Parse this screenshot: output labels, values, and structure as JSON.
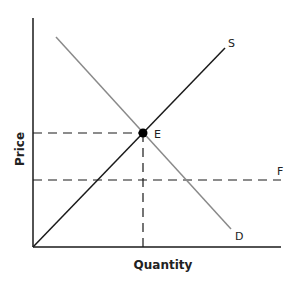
{
  "diagram": {
    "type": "supply-demand",
    "axes": {
      "x_label": "Quantity",
      "y_label": "Price"
    },
    "curves": [
      {
        "id": "supply",
        "label": "S",
        "color": "#1a1a1a"
      },
      {
        "id": "demand",
        "label": "D",
        "color": "#8a8a8a"
      },
      {
        "id": "price-floor",
        "label": "F",
        "style": "dashed",
        "color": "#1a1a1a"
      }
    ],
    "points": [
      {
        "id": "equilibrium",
        "label": "E"
      }
    ],
    "colors": {
      "axis": "#1a1a1a",
      "supply": "#1a1a1a",
      "demand": "#8a8a8a",
      "dashed": "#1a1a1a"
    }
  }
}
